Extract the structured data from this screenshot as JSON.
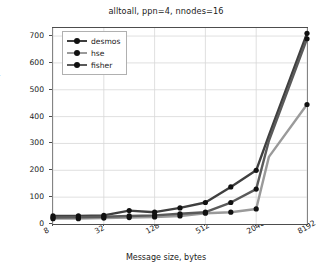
{
  "chart_data": {
    "type": "line",
    "title": "alltoall, ppn=4, nnodes=16",
    "xlabel": "Message size, bytes",
    "ylabel": "Time, usec",
    "xscale": "log2",
    "grid": true,
    "legend_position": "upper-left",
    "xlim": [
      8,
      8192
    ],
    "ylim": [
      0,
      730
    ],
    "x": [
      8,
      16,
      32,
      64,
      128,
      256,
      512,
      1024,
      2048,
      2896,
      8192
    ],
    "xticks": [
      {
        "value": 8,
        "label": "8"
      },
      {
        "value": 32,
        "label": "32"
      },
      {
        "value": 128,
        "label": "128"
      },
      {
        "value": 512,
        "label": "512"
      },
      {
        "value": 2048,
        "label": "2048"
      },
      {
        "value": 8192,
        "label": "8192"
      }
    ],
    "yticks": [
      {
        "value": 0,
        "label": "0"
      },
      {
        "value": 100,
        "label": "100"
      },
      {
        "value": 200,
        "label": "200"
      },
      {
        "value": 300,
        "label": "300"
      },
      {
        "value": 400,
        "label": "400"
      },
      {
        "value": 500,
        "label": "500"
      },
      {
        "value": 600,
        "label": "600"
      },
      {
        "value": 700,
        "label": "700"
      }
    ],
    "series": [
      {
        "name": "desmos",
        "color": "#3f3f3f",
        "values": [
          30,
          30,
          32,
          50,
          44,
          60,
          80,
          138,
          200,
          330,
          710
        ]
      },
      {
        "name": "hse",
        "color": "#9a9a9a",
        "values": [
          20,
          20,
          22,
          24,
          26,
          30,
          40,
          44,
          56,
          250,
          445
        ]
      },
      {
        "name": "fisher",
        "color": "#5a5a5a",
        "values": [
          24,
          25,
          27,
          30,
          32,
          38,
          44,
          80,
          130,
          310,
          690
        ]
      }
    ]
  },
  "legend": {
    "items": [
      {
        "label": "desmos"
      },
      {
        "label": "hse"
      },
      {
        "label": "fisher"
      }
    ]
  }
}
